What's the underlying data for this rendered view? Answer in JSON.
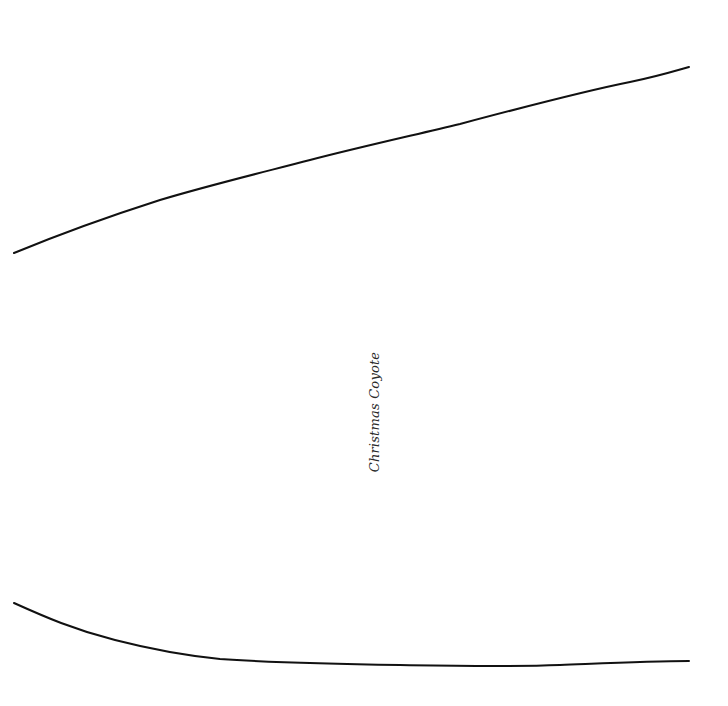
{
  "page": {
    "title": "Christmas Coyote",
    "stroke_color": "#111111",
    "background": "#ffffff"
  }
}
